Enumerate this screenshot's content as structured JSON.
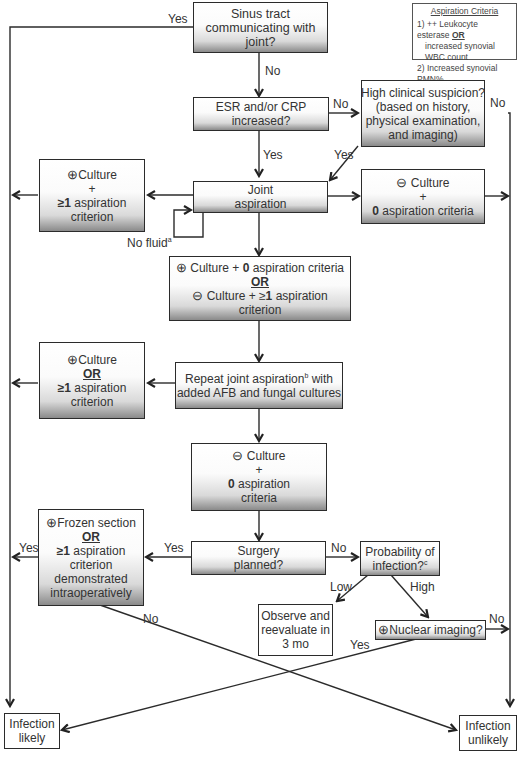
{
  "legend": {
    "title": "Aspiration Criteria",
    "line1_a": "1) ++ Leukocyte esterase ",
    "line1_or": "OR",
    "line1_b": "increased synovial WBC count",
    "line2": "2) Increased synovial PMN%"
  },
  "nodes": {
    "sinus": {
      "l1": "Sinus tract",
      "l2": "communicating with",
      "l3": "joint?"
    },
    "esr": {
      "l1": "ESR and/or CRP",
      "l2": "increased?"
    },
    "suspicion": {
      "l1": "High clinical suspicion?",
      "l2": "(based on history,",
      "l3": "physical examination,",
      "l4": "and imaging)"
    },
    "aspiration": {
      "l1": "Joint",
      "l2": "aspiration"
    },
    "pos_culture_1": {
      "sym": "⊕",
      "l1": "Culture",
      "l2": "+",
      "l3_bold": "≥1",
      "l3": " aspiration",
      "l4": "criterion"
    },
    "neg_culture_1": {
      "sym": "⊖",
      "l1": " Culture",
      "l2": "+",
      "l3_bold": "0",
      "l3": " aspiration criteria"
    },
    "mixed": {
      "sym1": "⊕",
      "l1_a": " Culture + ",
      "l1_b": "0",
      "l1_c": " aspiration criteria",
      "or": "OR",
      "sym2": "⊖",
      "l3_a": " Culture + ≥",
      "l3_b": "1",
      "l3_c": " aspiration",
      "l4": "criterion"
    },
    "repeat": {
      "l1_a": "Repeat joint aspiration",
      "l1_sup": "b",
      "l1_b": " with",
      "l2": "added AFB and fungal cultures"
    },
    "pos_culture_2": {
      "sym": "⊕",
      "l1": "Culture",
      "or": "OR",
      "l3_bold": "≥1",
      "l3": " aspiration",
      "l4": "criterion"
    },
    "neg_culture_2": {
      "sym": "⊖",
      "l1": " Culture",
      "l2": "+",
      "l3_bold": "0",
      "l3": " aspiration",
      "l4": "criteria"
    },
    "frozen": {
      "sym": "⊕",
      "l1": "Frozen section",
      "or": "OR",
      "l3_bold": "≥1",
      "l3": " aspiration",
      "l4": "criterion",
      "l5": "demonstrated",
      "l6": "intraoperatively"
    },
    "surgery": {
      "l1": "Surgery",
      "l2": "planned?"
    },
    "probability": {
      "l1": "Probability of",
      "l2": "infection?",
      "l2_sup": "c"
    },
    "observe": {
      "l1": "Observe and",
      "l2": "reevaluate in",
      "l3": "3 mo"
    },
    "nuclear": {
      "sym": "⊕",
      "l1": "Nuclear imaging?"
    },
    "likely": {
      "l1": "Infection",
      "l2": "likely"
    },
    "unlikely": {
      "l1": "Infection",
      "l2": "unlikely"
    }
  },
  "edge_labels": {
    "sinus_yes": "Yes",
    "sinus_no": "No",
    "esr_no": "No",
    "esr_yes": "Yes",
    "suspicion_yes": "Yes",
    "suspicion_no": "No",
    "no_fluid": "No fluid",
    "no_fluid_sup": "a",
    "surgery_yes": "Yes",
    "frozen_yes": "Yes",
    "frozen_no": "No",
    "surgery_no": "No",
    "prob_low": "Low",
    "prob_high": "High",
    "nuclear_no": "No",
    "nuclear_yes": "Yes"
  }
}
